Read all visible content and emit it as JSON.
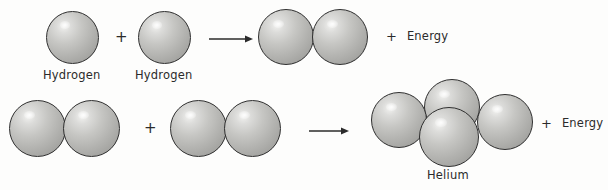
{
  "diagram": {
    "background_color": "#fdfdfc",
    "sphere_color": "#b4b4b1",
    "outline_color": "#2f2f2f",
    "text_color": "#2b2b2b",
    "symbols": {
      "plus": "+",
      "arrow": "arrow-right"
    },
    "rows": [
      {
        "id": "row-hydrogen-fusion",
        "labels": {
          "reactant_left": "Hydrogen",
          "reactant_right": "Hydrogen"
        },
        "energy": {
          "sign": "+",
          "text": "Energy"
        }
      },
      {
        "id": "row-helium-fusion",
        "labels": {
          "product": "Helium"
        },
        "energy": {
          "sign": "+",
          "text": "Energy"
        }
      }
    ],
    "spheres": {
      "row1_reactant_left": [
        {
          "name": "hydrogen-nucleon-1",
          "x": 46,
          "y": 11,
          "d": 53
        }
      ],
      "row1_reactant_right": [
        {
          "name": "hydrogen-nucleon-2",
          "x": 138,
          "y": 11,
          "d": 53
        }
      ],
      "row1_product": [
        {
          "name": "deuterium-nucleon-1",
          "x": 258,
          "y": 9,
          "d": 56
        },
        {
          "name": "deuterium-nucleon-2",
          "x": 312,
          "y": 9,
          "d": 56
        }
      ],
      "row2_reactant_left": [
        {
          "name": "deuterium-a-nucleon-1",
          "x": 9,
          "y": 100,
          "d": 57
        },
        {
          "name": "deuterium-a-nucleon-2",
          "x": 63,
          "y": 100,
          "d": 57
        }
      ],
      "row2_reactant_right": [
        {
          "name": "deuterium-b-nucleon-1",
          "x": 170,
          "y": 100,
          "d": 57
        },
        {
          "name": "deuterium-b-nucleon-2",
          "x": 224,
          "y": 100,
          "d": 57
        }
      ],
      "row2_product_helium": [
        {
          "name": "helium-nucleon-top",
          "x": 424,
          "y": 79,
          "d": 56
        },
        {
          "name": "helium-nucleon-left",
          "x": 371,
          "y": 92,
          "d": 56
        },
        {
          "name": "helium-nucleon-right",
          "x": 477,
          "y": 94,
          "d": 56
        },
        {
          "name": "helium-nucleon-front",
          "x": 419,
          "y": 107,
          "d": 60
        }
      ]
    }
  }
}
